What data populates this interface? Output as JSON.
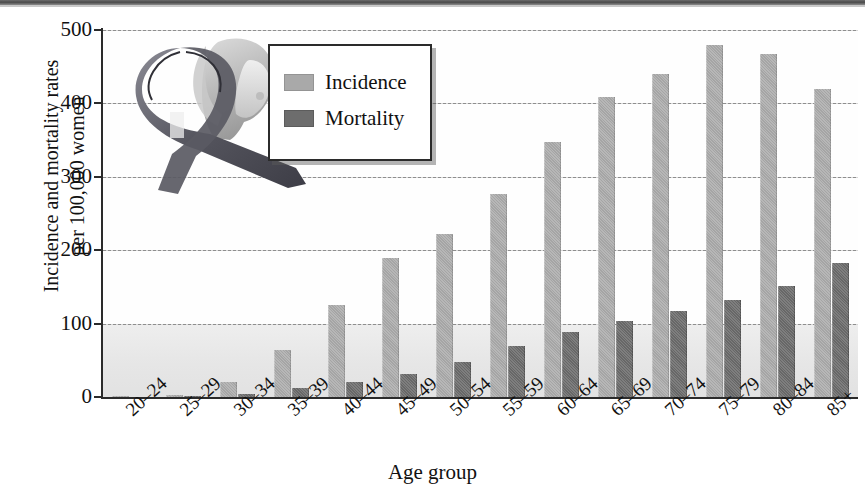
{
  "chart_data": {
    "type": "bar",
    "title": "",
    "xlabel": "Age group",
    "ylabel": "Incidence and mortality rates per 100,000 women",
    "ylabel_lines": [
      "Incidence and mortality rates",
      "per 100,000 women"
    ],
    "categories": [
      "20–24",
      "25–29",
      "30–34",
      "35–39",
      "40–44",
      "45–49",
      "50–54",
      "55–59",
      "60–64",
      "65–69",
      "70–74",
      "75–79",
      "80–84",
      "85+"
    ],
    "series": [
      {
        "name": "Incidence",
        "color": "#a9a9a9",
        "values": [
          1,
          3,
          21,
          64,
          126,
          189,
          222,
          276,
          348,
          409,
          440,
          479,
          468,
          420
        ]
      },
      {
        "name": "Mortality",
        "color": "#6d6d6d",
        "values": [
          0,
          1,
          4,
          12,
          21,
          32,
          48,
          70,
          89,
          104,
          117,
          132,
          151,
          183
        ]
      }
    ],
    "ylim": [
      0,
      500
    ],
    "yticks": [
      0,
      100,
      200,
      300,
      400,
      500
    ],
    "grid": true,
    "legend_position": "upper-left-inset"
  },
  "legend": {
    "items": [
      {
        "label": "Incidence",
        "color": "#a9a9a9"
      },
      {
        "label": "Mortality",
        "color": "#6d6d6d"
      }
    ]
  },
  "axes": {
    "y_title_line1": "Incidence and mortality rates",
    "y_title_line2": "per 100,000 women",
    "x_title": "Age group",
    "y_ticks": [
      "0",
      "100",
      "200",
      "300",
      "400",
      "500"
    ]
  },
  "colors": {
    "incidence": "#a9a9a9",
    "mortality": "#6d6d6d",
    "axis": "#2b2b2b",
    "grid": "#8e8e8e",
    "plot_background": "#fefefe",
    "ribbon_dark": "#4e4e56",
    "ribbon_light": "#8f8f99"
  },
  "artwork": {
    "name": "pink-ribbon-and-woman-illustration"
  }
}
